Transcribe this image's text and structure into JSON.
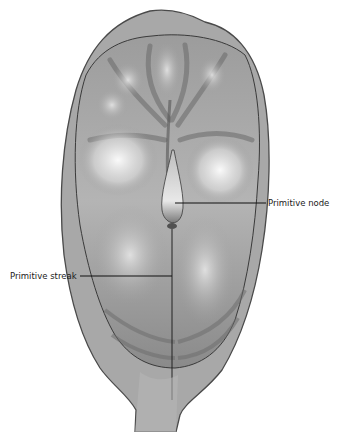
{
  "figure": {
    "labels": [
      {
        "id": "primitive-node",
        "text": "Primitive node"
      },
      {
        "id": "primitive-streak",
        "text": "Primitive streak"
      }
    ],
    "colors": {
      "outer_membrane": "#9a9a9a",
      "disc": "#8c8c8c",
      "highlight": "#f2f2f2",
      "outline": "#3a3a3a",
      "leader_line": "#111111"
    }
  }
}
